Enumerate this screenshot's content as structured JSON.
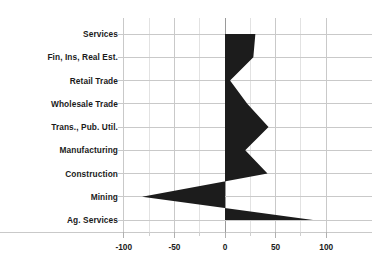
{
  "chart_data": {
    "type": "bar",
    "title": "",
    "subtitle": "",
    "xlabel": "",
    "ylabel": "",
    "orientation": "horizontal",
    "style": "filled-polygon-area",
    "grid": true,
    "legend": null,
    "xlim": [
      -110,
      110
    ],
    "xticks": [
      -100,
      -50,
      0,
      50,
      100
    ],
    "xtick_labels": [
      "-100",
      "-50",
      "0",
      "50",
      "100"
    ],
    "minor_xticks": [
      -75,
      -25,
      25,
      75
    ],
    "categories": [
      "Services",
      "Fin, Ins, Real Est.",
      "Retail Trade",
      "Wholesale Trade",
      "Trans., Pub. Util.",
      "Manufacturing",
      "Construction",
      "Mining",
      "Ag. Services"
    ],
    "values": [
      30,
      28,
      5,
      22,
      43,
      20,
      42,
      -82,
      87
    ],
    "series": [
      {
        "name": "Percent change",
        "values": [
          30,
          28,
          5,
          22,
          43,
          20,
          42,
          -82,
          87
        ],
        "color": "#1c1c1c"
      }
    ],
    "zero_line": 0,
    "colors": {
      "fill": "#1c1c1c",
      "grid": "#c9c9c9",
      "zero_axis": "#9a9a9a",
      "text": "#1a1a1a",
      "background": "#ffffff"
    }
  },
  "axis": {
    "tick_labels": [
      "-100",
      "-50",
      "0",
      "50",
      "100"
    ]
  },
  "labels": {
    "items": [
      "Services",
      "Fin, Ins, Real Est.",
      "Retail Trade",
      "Wholesale Trade",
      "Trans., Pub. Util.",
      "Manufacturing",
      "Construction",
      "Mining",
      "Ag. Services"
    ]
  }
}
